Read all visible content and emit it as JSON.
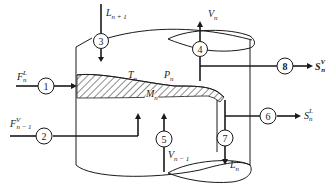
{
  "diagram": {
    "colors": {
      "ink": "#1a1a1a",
      "background": "#ffffff"
    },
    "variables": {
      "temperature": {
        "main": "T",
        "sub": "n"
      },
      "pressure": {
        "main": "P",
        "sub": "n"
      },
      "holdup": {
        "main": "M",
        "sub": "n"
      }
    },
    "nodes": [
      {
        "id": "1",
        "label": "1",
        "stream": {
          "main": "F",
          "sup": "L",
          "sub": "n"
        },
        "direction": "in"
      },
      {
        "id": "2",
        "label": "2",
        "stream": {
          "main": "F",
          "sup": "V",
          "sub": "n − 1"
        },
        "direction": "in"
      },
      {
        "id": "3",
        "label": "3",
        "stream": {
          "main": "L",
          "sub": "n + 1"
        },
        "direction": "in"
      },
      {
        "id": "4",
        "label": "4",
        "stream": {
          "main": "V",
          "sub": "n"
        },
        "direction": "out"
      },
      {
        "id": "5",
        "label": "5",
        "stream": {
          "main": "V",
          "sub": "n − 1"
        },
        "direction": "in"
      },
      {
        "id": "6",
        "label": "6",
        "stream": {
          "main": "S",
          "sup": "L",
          "sub": "n"
        },
        "direction": "out"
      },
      {
        "id": "7",
        "label": "7",
        "stream": {
          "main": "L",
          "sub": "n"
        },
        "direction": "out"
      },
      {
        "id": "8",
        "label": "8",
        "stream": {
          "main": "S",
          "sup": "V",
          "sub": "n"
        },
        "direction": "out"
      }
    ]
  }
}
